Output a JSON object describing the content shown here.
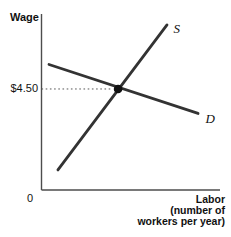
{
  "chart_data": {
    "type": "line",
    "title": "",
    "ylabel": "Wage",
    "xlabel": "Labor (number of workers per year)",
    "xlabel_lines": [
      "Labor",
      "(number of",
      "workers per year)"
    ],
    "origin_label": "0",
    "axes": {
      "grid": false,
      "x_percent_range": [
        0,
        100
      ],
      "y_percent_range": [
        0,
        100
      ],
      "tick_labels_y": [
        "$4.50"
      ]
    },
    "series": [
      {
        "name": "S",
        "role": "supply",
        "points_percent": [
          [
            9.2,
            11.4
          ],
          [
            70.3,
            93.8
          ]
        ]
      },
      {
        "name": "D",
        "role": "demand",
        "points_percent": [
          [
            4.2,
            71.3
          ],
          [
            87.7,
            43.5
          ]
        ]
      }
    ],
    "equilibrium": {
      "wage_label": "$4.50",
      "point_percent": [
        42.9,
        57.4
      ]
    },
    "colors": {
      "curve": "#333333",
      "axis": "#4d4d4d",
      "dot": "#111111",
      "guide": "#555555",
      "text": "#111111",
      "background": "#ffffff"
    }
  }
}
